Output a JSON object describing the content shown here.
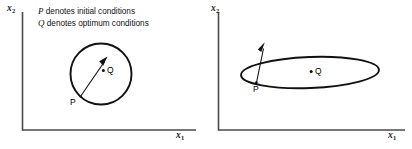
{
  "figure": {
    "background_color": "#ffffff",
    "line_color": "#111111",
    "panels": [
      {
        "id": "left",
        "name": "circular-contour-panel",
        "axis_x_label": "x",
        "axis_x_sub": "1",
        "axis_y_label": "x",
        "axis_y_sub": "2",
        "legend": [
          {
            "symbol": "P",
            "text": " denotes initial conditions"
          },
          {
            "symbol": "Q",
            "text": " denotes optimum conditions"
          }
        ],
        "contour_shape": "circle",
        "point_p_label": "P",
        "point_q_label": "Q",
        "arrow_description": "gradient-arrow-from-P-to-Q"
      },
      {
        "id": "right",
        "name": "elliptical-contour-panel",
        "axis_x_label": "x",
        "axis_x_sub": "1",
        "axis_y_label": "x",
        "axis_y_sub": "2",
        "contour_shape": "ellipse",
        "point_p_label": "P",
        "point_q_label": "Q",
        "arrow_description": "gradient-arrow-at-P-steep"
      }
    ]
  }
}
